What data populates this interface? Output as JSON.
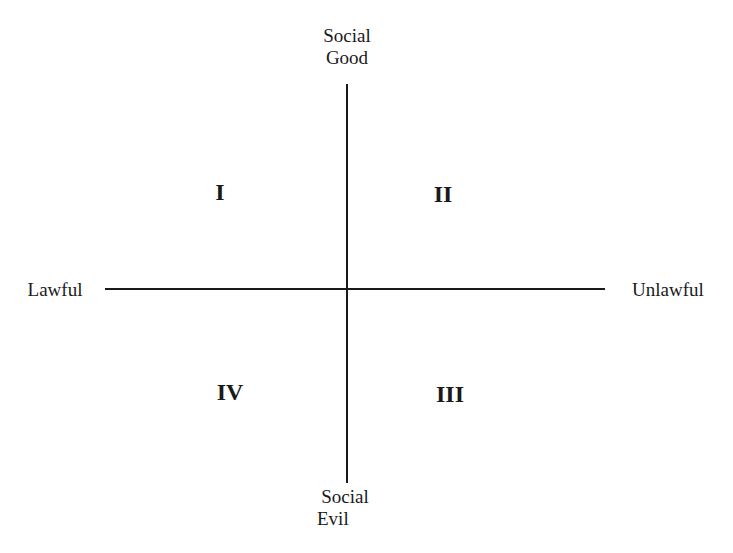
{
  "diagram": {
    "axes": {
      "vertical": {
        "top_label_line1": "Social",
        "top_label_line2": "Good",
        "bottom_label_line1": "Social",
        "bottom_label_line2": "Evil"
      },
      "horizontal": {
        "left_label": "Lawful",
        "right_label": "Unlawful"
      }
    },
    "quadrants": [
      {
        "id": "I",
        "label": "I",
        "position": "top-left"
      },
      {
        "id": "II",
        "label": "II",
        "position": "top-right"
      },
      {
        "id": "III",
        "label": "III",
        "position": "bottom-right"
      },
      {
        "id": "IV",
        "label": "IV",
        "position": "bottom-left"
      }
    ],
    "line_color": "#1a1a1a"
  }
}
